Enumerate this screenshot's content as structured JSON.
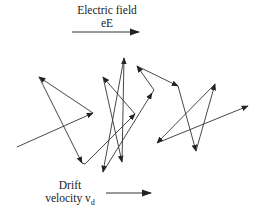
{
  "diagram": {
    "electric_field": {
      "label": "Electric field",
      "symbol": "eE",
      "arrow": {
        "x1": 72,
        "y1": 32,
        "x2": 139,
        "y2": 32
      }
    },
    "drift": {
      "label": "Drift",
      "symbol_text": "velocity v",
      "symbol_sub": "d",
      "arrow": {
        "x1": 106,
        "y1": 193,
        "x2": 151,
        "y2": 193
      }
    },
    "path_points": [
      [
        17,
        147
      ],
      [
        93,
        113
      ],
      [
        39,
        77
      ],
      [
        82,
        163
      ],
      [
        85,
        164
      ],
      [
        135,
        114
      ],
      [
        103,
        77
      ],
      [
        122,
        162
      ],
      [
        124,
        58
      ],
      [
        103,
        172
      ],
      [
        152,
        93
      ],
      [
        154,
        90
      ],
      [
        137,
        66
      ],
      [
        178,
        86
      ],
      [
        196,
        151
      ],
      [
        215,
        84
      ],
      [
        157,
        143
      ],
      [
        248,
        106
      ]
    ],
    "arrowed_segments": [
      [
        0,
        1
      ],
      [
        1,
        2
      ],
      [
        2,
        3
      ],
      [
        4,
        5
      ],
      [
        5,
        6
      ],
      [
        6,
        7
      ],
      [
        7,
        8
      ],
      [
        8,
        9
      ],
      [
        9,
        10
      ],
      [
        11,
        12
      ],
      [
        12,
        13
      ],
      [
        13,
        14
      ],
      [
        14,
        15
      ],
      [
        15,
        16
      ],
      [
        16,
        17
      ]
    ],
    "colors": {
      "line": "#333333",
      "text": "#222222",
      "background": "#ffffff"
    }
  }
}
